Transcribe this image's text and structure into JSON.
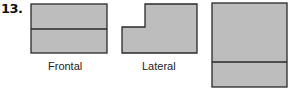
{
  "problem_number": "13.",
  "colors": {
    "fill": "#bdbdbd",
    "stroke": "#2a2a2a",
    "background": "#ffffff"
  },
  "views": [
    {
      "label": "Frontal",
      "shape": "rectangle divided horizontally near middle"
    },
    {
      "label": "Lateral",
      "shape": "L-shaped profile with notch at upper-left"
    },
    {
      "label": "",
      "shape": "tall rectangle divided horizontally near bottom"
    }
  ]
}
